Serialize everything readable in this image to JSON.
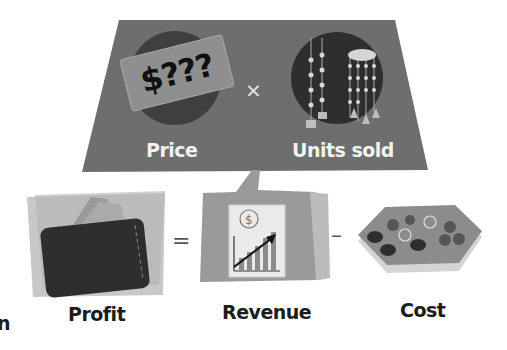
{
  "top_panel": {
    "price_tag_text": "$???",
    "price_label": "Price",
    "times_operator": "×",
    "units_label": "Units sold"
  },
  "bottom_row": {
    "profit_label": "Profit",
    "equals_operator": "=",
    "revenue_label": "Revenue",
    "revenue_icon_symbol": "$",
    "minus_operator": "–",
    "cost_label": "Cost"
  },
  "edge_fragment": {
    "text": "n"
  },
  "colors": {
    "panel_dark": "#6e6e6e",
    "panel_light": "#bdbdbd",
    "revenue_panel": "#9a9a9a",
    "text_dark": "#1c1c1c",
    "text_light": "#f2f2f2"
  }
}
